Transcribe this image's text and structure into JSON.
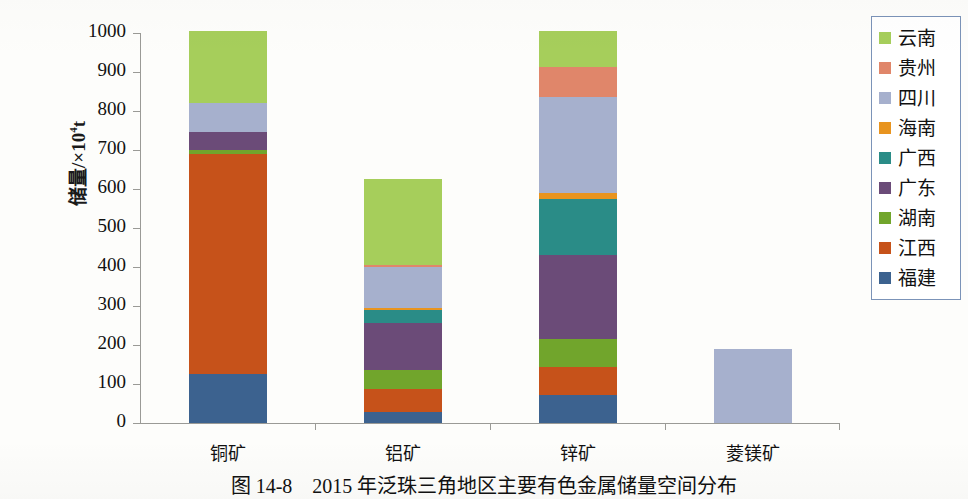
{
  "figure": {
    "caption": "图 14-8　2015 年泛珠三角地区主要有色金属储量空间分布",
    "ylabel_text": "储量/×10",
    "ylabel_sup": "4",
    "ylabel_unit": "t"
  },
  "legend": {
    "position": "right",
    "items": [
      {
        "label": "云南",
        "color": "#a6ce5b"
      },
      {
        "label": "贵州",
        "color": "#e0866a"
      },
      {
        "label": "四川",
        "color": "#a6b0cd"
      },
      {
        "label": "海南",
        "color": "#e8941f"
      },
      {
        "label": "广西",
        "color": "#2a8c87"
      },
      {
        "label": "广东",
        "color": "#6b4b78"
      },
      {
        "label": "湖南",
        "color": "#71a52c"
      },
      {
        "label": "江西",
        "color": "#c6521a"
      },
      {
        "label": "福建",
        "color": "#3c628f"
      }
    ]
  },
  "chart_data": {
    "type": "bar",
    "stacked": true,
    "title": "2015 年泛珠三角地区主要有色金属储量空间分布",
    "xlabel": "",
    "ylabel": "储量/×10⁴t",
    "ylim": [
      0,
      1000
    ],
    "ytick_values": [
      0,
      100,
      200,
      300,
      400,
      500,
      600,
      700,
      800,
      900,
      1000
    ],
    "ytick_labels": [
      "0",
      "100",
      "200",
      "300",
      "400",
      "500",
      "600",
      "700",
      "800",
      "900",
      "1000"
    ],
    "grid": false,
    "categories": [
      "铜矿",
      "铝矿",
      "锌矿",
      "菱镁矿"
    ],
    "series": [
      {
        "name": "福建",
        "color": "#3c628f",
        "values": [
          125,
          28,
          72,
          0
        ]
      },
      {
        "name": "江西",
        "color": "#c6521a",
        "values": [
          565,
          58,
          72,
          0
        ]
      },
      {
        "name": "湖南",
        "color": "#71a52c",
        "values": [
          10,
          50,
          71,
          0
        ]
      },
      {
        "name": "广东",
        "color": "#6b4b78",
        "values": [
          45,
          120,
          215,
          0
        ]
      },
      {
        "name": "广西",
        "color": "#2a8c87",
        "values": [
          0,
          35,
          145,
          0
        ]
      },
      {
        "name": "海南",
        "color": "#e8941f",
        "values": [
          0,
          4,
          15,
          0
        ]
      },
      {
        "name": "四川",
        "color": "#a6b0cd",
        "values": [
          75,
          105,
          245,
          190
        ]
      },
      {
        "name": "贵州",
        "color": "#e0866a",
        "values": [
          0,
          6,
          77,
          0
        ]
      },
      {
        "name": "云南",
        "color": "#a6ce5b",
        "values": [
          185,
          219,
          93,
          0
        ]
      }
    ],
    "totals": [
      1005,
      625,
      1005,
      190
    ],
    "stack_order_bottom_to_top": [
      "福建",
      "江西",
      "湖南",
      "广东",
      "广西",
      "海南",
      "四川",
      "贵州",
      "云南"
    ]
  }
}
